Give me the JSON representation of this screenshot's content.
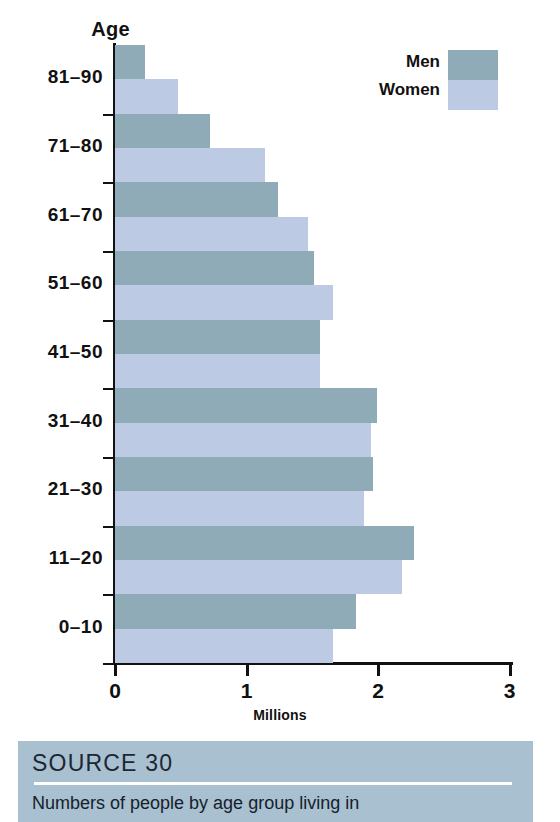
{
  "figure": {
    "y_axis_title": "Age",
    "x_axis_title": "Millions",
    "x_ticks": [
      "0",
      "1",
      "2",
      "3"
    ],
    "age_labels": [
      "81–90",
      "71–80",
      "61–70",
      "51–60",
      "41–50",
      "31–40",
      "21–30",
      "11–20",
      "0–10"
    ],
    "legend": {
      "men_label": "Men",
      "women_label": "Women",
      "men_color": "#8fabb8",
      "women_color": "#bccae3"
    }
  },
  "source": {
    "title": "SOURCE 30",
    "caption": "Numbers of people by age group living in"
  },
  "chart_data": {
    "type": "bar",
    "orientation": "horizontal",
    "title": "",
    "xlabel": "Millions",
    "ylabel": "Age",
    "xlim": [
      0,
      3
    ],
    "grid": false,
    "legend_position": "top-right",
    "categories": [
      "81–90",
      "71–80",
      "61–70",
      "51–60",
      "41–50",
      "31–40",
      "21–30",
      "11–20",
      "0–10"
    ],
    "series": [
      {
        "name": "Men",
        "color": "#8fabb8",
        "values": [
          0.23,
          0.72,
          1.24,
          1.51,
          1.56,
          1.99,
          1.96,
          2.27,
          1.83
        ]
      },
      {
        "name": "Women",
        "color": "#bccae3",
        "values": [
          0.48,
          1.14,
          1.47,
          1.66,
          1.56,
          1.95,
          1.89,
          2.18,
          1.66
        ]
      }
    ]
  }
}
